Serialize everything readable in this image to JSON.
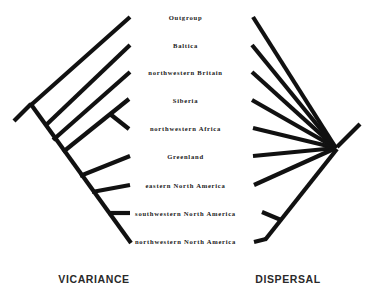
{
  "figure": {
    "type": "cladogram-pair",
    "background_color": "#ffffff",
    "line_color": "#111111",
    "taxa": [
      {
        "label": "Outgroup",
        "y": 17
      },
      {
        "label": "Baltica",
        "y": 45
      },
      {
        "label": "northwestern Britain",
        "y": 72
      },
      {
        "label": "Siberia",
        "y": 100
      },
      {
        "label": "northwestern Africa",
        "y": 128
      },
      {
        "label": "Greenland",
        "y": 156
      },
      {
        "label": "eastern North America",
        "y": 185
      },
      {
        "label": "southwestern North America",
        "y": 213
      },
      {
        "label": "northwestern North America",
        "y": 241
      }
    ],
    "panels": [
      {
        "id": "left",
        "heading": "VICARIANCE",
        "topology": "pectinate-ladder"
      },
      {
        "id": "right",
        "heading": "DISPERSAL",
        "topology": "star-polytomy"
      }
    ]
  }
}
